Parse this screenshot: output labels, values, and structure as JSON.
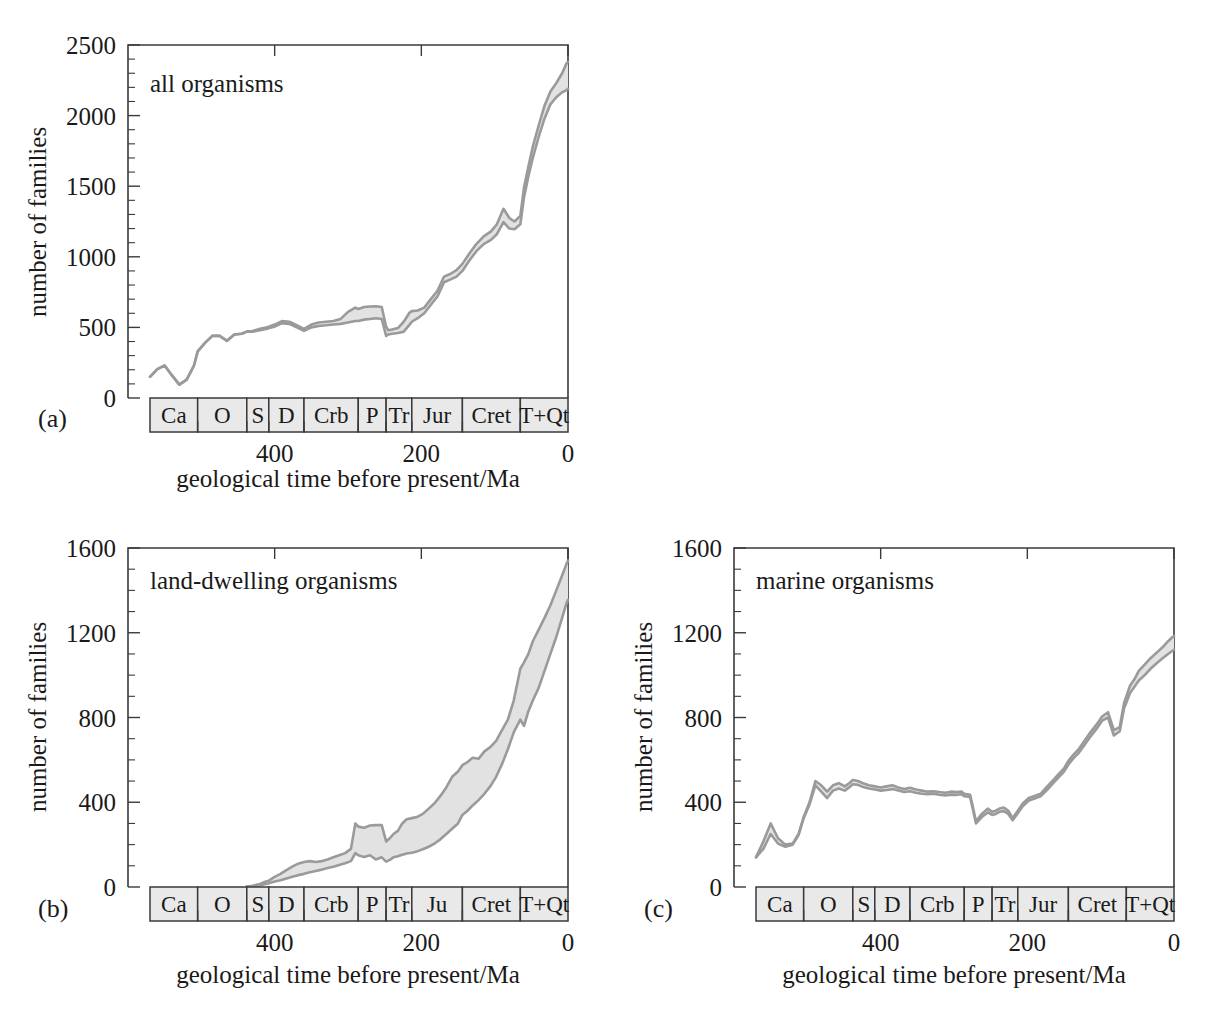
{
  "figure": {
    "shared_xlabel": "geological time before present/Ma",
    "shared_ylabel": "number of families",
    "xtick_labels": [
      "400",
      "200",
      "0"
    ],
    "xtick_values": [
      400,
      200,
      0
    ],
    "band_color": "#e2e2e2",
    "line_color": "#9a9a9a",
    "period_fill": "#e9e9e9"
  },
  "chart_data": [
    {
      "id": "a",
      "type": "area",
      "caption": "(a)",
      "title": "all organisms",
      "xlabel": "geological time before present/Ma",
      "ylabel": "number of families",
      "xlim": [
        600,
        0
      ],
      "ylim": [
        0,
        2500
      ],
      "ytick_labels": [
        "0",
        "500",
        "1000",
        "1500",
        "2000",
        "2500"
      ],
      "ytick_values": [
        0,
        500,
        1000,
        1500,
        2000,
        2500
      ],
      "yminor_step": 100,
      "grid": false,
      "legend": "none",
      "periods": [
        {
          "abbr": "Ca",
          "start": 570,
          "end": 505
        },
        {
          "abbr": "O",
          "start": 505,
          "end": 438
        },
        {
          "abbr": "S",
          "start": 438,
          "end": 408
        },
        {
          "abbr": "D",
          "start": 408,
          "end": 360
        },
        {
          "abbr": "Crb",
          "start": 360,
          "end": 286
        },
        {
          "abbr": "P",
          "start": 286,
          "end": 248
        },
        {
          "abbr": "Tr",
          "start": 248,
          "end": 213
        },
        {
          "abbr": "Jur",
          "start": 213,
          "end": 144
        },
        {
          "abbr": "Cret",
          "start": 144,
          "end": 65
        },
        {
          "abbr": "T+Qt",
          "start": 65,
          "end": 0
        }
      ],
      "series": [
        {
          "name": "upper estimate",
          "x": [
            570,
            560,
            550,
            540,
            530,
            520,
            510,
            505,
            495,
            485,
            475,
            465,
            455,
            445,
            438,
            430,
            420,
            410,
            408,
            400,
            390,
            380,
            370,
            360,
            350,
            340,
            330,
            320,
            310,
            300,
            290,
            286,
            278,
            270,
            262,
            254,
            248,
            245,
            240,
            232,
            224,
            216,
            213,
            205,
            196,
            187,
            178,
            169,
            160,
            152,
            144,
            135,
            125,
            115,
            105,
            97,
            88,
            80,
            73,
            65,
            60,
            54,
            48,
            40,
            32,
            24,
            16,
            8,
            2,
            0
          ],
          "y": [
            150,
            205,
            230,
            160,
            95,
            130,
            230,
            330,
            390,
            440,
            440,
            405,
            450,
            455,
            470,
            475,
            490,
            500,
            505,
            520,
            545,
            540,
            515,
            490,
            520,
            535,
            540,
            545,
            560,
            610,
            640,
            630,
            645,
            648,
            650,
            645,
            505,
            480,
            485,
            495,
            540,
            605,
            615,
            620,
            640,
            700,
            760,
            860,
            880,
            905,
            950,
            1020,
            1090,
            1145,
            1180,
            1230,
            1340,
            1275,
            1250,
            1290,
            1490,
            1640,
            1780,
            1930,
            2070,
            2170,
            2230,
            2300,
            2370,
            2380
          ]
        },
        {
          "name": "lower estimate",
          "x": [
            570,
            560,
            550,
            540,
            530,
            520,
            510,
            505,
            495,
            485,
            475,
            465,
            455,
            445,
            438,
            430,
            420,
            410,
            408,
            400,
            390,
            380,
            370,
            360,
            350,
            340,
            330,
            320,
            310,
            300,
            290,
            286,
            278,
            270,
            262,
            254,
            248,
            245,
            240,
            232,
            224,
            216,
            213,
            205,
            196,
            187,
            178,
            169,
            160,
            152,
            144,
            135,
            125,
            115,
            105,
            97,
            88,
            80,
            73,
            65,
            60,
            54,
            48,
            40,
            32,
            24,
            16,
            8,
            2,
            0
          ],
          "y": [
            150,
            205,
            230,
            160,
            95,
            130,
            230,
            330,
            390,
            440,
            440,
            405,
            450,
            455,
            470,
            470,
            480,
            490,
            495,
            505,
            530,
            525,
            500,
            475,
            500,
            510,
            515,
            520,
            525,
            535,
            545,
            545,
            555,
            560,
            565,
            560,
            440,
            450,
            455,
            460,
            470,
            520,
            540,
            565,
            600,
            660,
            720,
            820,
            840,
            860,
            900,
            970,
            1040,
            1090,
            1120,
            1160,
            1245,
            1200,
            1195,
            1230,
            1420,
            1570,
            1700,
            1850,
            1980,
            2080,
            2130,
            2165,
            2180,
            2190
          ]
        }
      ]
    },
    {
      "id": "b",
      "type": "area",
      "caption": "(b)",
      "title": "land-dwelling organisms",
      "xlabel": "geological time before present/Ma",
      "ylabel": "number of families",
      "xlim": [
        600,
        0
      ],
      "ylim": [
        0,
        1600
      ],
      "ytick_labels": [
        "0",
        "400",
        "800",
        "1200",
        "1600"
      ],
      "ytick_values": [
        0,
        400,
        800,
        1200,
        1600
      ],
      "yminor_step": 100,
      "grid": false,
      "legend": "none",
      "periods": [
        {
          "abbr": "Ca",
          "start": 570,
          "end": 505
        },
        {
          "abbr": "O",
          "start": 505,
          "end": 438
        },
        {
          "abbr": "S",
          "start": 438,
          "end": 408
        },
        {
          "abbr": "D",
          "start": 408,
          "end": 360
        },
        {
          "abbr": "Crb",
          "start": 360,
          "end": 286
        },
        {
          "abbr": "P",
          "start": 286,
          "end": 248
        },
        {
          "abbr": "Tr",
          "start": 248,
          "end": 213
        },
        {
          "abbr": "Ju",
          "start": 213,
          "end": 144
        },
        {
          "abbr": "Cret",
          "start": 144,
          "end": 65
        },
        {
          "abbr": "T+Qt",
          "start": 65,
          "end": 0
        }
      ],
      "series": [
        {
          "name": "upper estimate",
          "x": [
            438,
            430,
            420,
            415,
            408,
            400,
            392,
            384,
            376,
            368,
            360,
            352,
            344,
            336,
            328,
            320,
            312,
            304,
            296,
            290,
            286,
            278,
            270,
            262,
            254,
            248,
            243,
            238,
            232,
            226,
            220,
            213,
            206,
            198,
            190,
            182,
            174,
            166,
            158,
            150,
            144,
            137,
            130,
            122,
            114,
            106,
            98,
            90,
            82,
            74,
            65,
            60,
            54,
            48,
            40,
            32,
            24,
            16,
            8,
            2,
            0
          ],
          "y": [
            2,
            6,
            14,
            22,
            30,
            48,
            62,
            80,
            96,
            110,
            118,
            122,
            118,
            122,
            130,
            140,
            150,
            160,
            180,
            300,
            285,
            280,
            290,
            292,
            292,
            215,
            230,
            250,
            265,
            300,
            320,
            325,
            330,
            345,
            370,
            395,
            430,
            470,
            520,
            545,
            575,
            590,
            610,
            605,
            640,
            660,
            690,
            740,
            790,
            880,
            1030,
            1060,
            1100,
            1160,
            1215,
            1270,
            1330,
            1400,
            1470,
            1525,
            1540
          ]
        },
        {
          "name": "lower estimate",
          "x": [
            438,
            430,
            420,
            415,
            408,
            400,
            392,
            384,
            376,
            368,
            360,
            352,
            344,
            336,
            328,
            320,
            312,
            304,
            296,
            290,
            286,
            278,
            270,
            262,
            254,
            248,
            243,
            238,
            232,
            226,
            220,
            213,
            206,
            198,
            190,
            182,
            174,
            166,
            158,
            150,
            144,
            137,
            130,
            122,
            114,
            106,
            98,
            90,
            82,
            74,
            65,
            60,
            54,
            48,
            40,
            32,
            24,
            16,
            8,
            2,
            0
          ],
          "y": [
            2,
            4,
            8,
            12,
            18,
            26,
            32,
            40,
            48,
            56,
            62,
            70,
            76,
            82,
            90,
            96,
            104,
            112,
            122,
            160,
            150,
            142,
            150,
            130,
            140,
            120,
            128,
            140,
            145,
            152,
            158,
            162,
            168,
            178,
            190,
            205,
            225,
            250,
            275,
            300,
            340,
            360,
            385,
            410,
            440,
            475,
            520,
            580,
            650,
            730,
            790,
            760,
            830,
            880,
            940,
            1020,
            1100,
            1180,
            1270,
            1340,
            1355
          ]
        }
      ]
    },
    {
      "id": "c",
      "type": "area",
      "caption": "(c)",
      "title": "marine organisms",
      "xlabel": "geological time before present/Ma",
      "ylabel": "number of families",
      "xlim": [
        600,
        0
      ],
      "ylim": [
        0,
        1600
      ],
      "ytick_labels": [
        "0",
        "400",
        "800",
        "1200",
        "1600"
      ],
      "ytick_values": [
        0,
        400,
        800,
        1200,
        1600
      ],
      "yminor_step": 100,
      "grid": false,
      "legend": "none",
      "periods": [
        {
          "abbr": "Ca",
          "start": 570,
          "end": 505
        },
        {
          "abbr": "O",
          "start": 505,
          "end": 438
        },
        {
          "abbr": "S",
          "start": 438,
          "end": 408
        },
        {
          "abbr": "D",
          "start": 408,
          "end": 360
        },
        {
          "abbr": "Crb",
          "start": 360,
          "end": 286
        },
        {
          "abbr": "P",
          "start": 286,
          "end": 248
        },
        {
          "abbr": "Tr",
          "start": 248,
          "end": 213
        },
        {
          "abbr": "Jur",
          "start": 213,
          "end": 144
        },
        {
          "abbr": "Cret",
          "start": 144,
          "end": 65
        },
        {
          "abbr": "T+Qt",
          "start": 65,
          "end": 0
        }
      ],
      "series": [
        {
          "name": "upper estimate",
          "x": [
            570,
            560,
            550,
            540,
            530,
            520,
            512,
            505,
            497,
            489,
            481,
            473,
            465,
            457,
            449,
            443,
            438,
            431,
            424,
            416,
            408,
            400,
            392,
            384,
            376,
            368,
            360,
            352,
            344,
            336,
            328,
            320,
            312,
            304,
            296,
            290,
            286,
            278,
            270,
            262,
            254,
            248,
            243,
            238,
            232,
            226,
            220,
            213,
            206,
            198,
            190,
            182,
            174,
            166,
            158,
            150,
            144,
            137,
            130,
            122,
            114,
            106,
            98,
            90,
            82,
            74,
            68,
            65,
            60,
            54,
            48,
            40,
            32,
            24,
            16,
            8,
            2,
            0
          ],
          "y": [
            140,
            215,
            300,
            230,
            200,
            205,
            250,
            330,
            400,
            500,
            480,
            450,
            480,
            490,
            475,
            490,
            505,
            500,
            490,
            480,
            475,
            470,
            475,
            480,
            470,
            462,
            468,
            460,
            455,
            450,
            452,
            448,
            445,
            450,
            448,
            450,
            440,
            435,
            310,
            345,
            370,
            355,
            360,
            370,
            375,
            360,
            325,
            360,
            395,
            420,
            430,
            440,
            470,
            500,
            530,
            560,
            595,
            625,
            650,
            690,
            730,
            765,
            805,
            825,
            740,
            755,
            870,
            900,
            950,
            980,
            1020,
            1050,
            1080,
            1105,
            1130,
            1160,
            1180,
            1185
          ]
        },
        {
          "name": "lower estimate",
          "x": [
            570,
            560,
            550,
            540,
            530,
            520,
            512,
            505,
            497,
            489,
            481,
            473,
            465,
            457,
            449,
            443,
            438,
            431,
            424,
            416,
            408,
            400,
            392,
            384,
            376,
            368,
            360,
            352,
            344,
            336,
            328,
            320,
            312,
            304,
            296,
            290,
            286,
            278,
            270,
            262,
            254,
            248,
            243,
            238,
            232,
            226,
            220,
            213,
            206,
            198,
            190,
            182,
            174,
            166,
            158,
            150,
            144,
            137,
            130,
            122,
            114,
            106,
            98,
            90,
            82,
            74,
            68,
            65,
            60,
            54,
            48,
            40,
            32,
            24,
            16,
            8,
            2,
            0
          ],
          "y": [
            140,
            180,
            250,
            205,
            190,
            200,
            245,
            325,
            390,
            480,
            450,
            420,
            455,
            465,
            455,
            470,
            485,
            482,
            472,
            465,
            460,
            455,
            458,
            462,
            455,
            448,
            452,
            445,
            440,
            438,
            440,
            435,
            432,
            436,
            435,
            438,
            428,
            425,
            300,
            330,
            352,
            340,
            345,
            355,
            358,
            345,
            315,
            348,
            382,
            408,
            418,
            428,
            455,
            485,
            515,
            545,
            578,
            608,
            632,
            670,
            710,
            745,
            785,
            800,
            715,
            735,
            845,
            870,
            915,
            945,
            975,
            1000,
            1030,
            1055,
            1078,
            1100,
            1115,
            1120
          ]
        }
      ]
    }
  ]
}
